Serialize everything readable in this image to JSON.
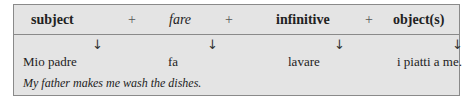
{
  "header": {
    "subject": "subject",
    "plus1": "+",
    "fare": "fare",
    "plus2": "+",
    "infinitive": "infinitive",
    "plus3": "+",
    "objects": "object(s)"
  },
  "arrows": {
    "glyph": "↓"
  },
  "example": {
    "subject": "Mio padre",
    "fare": "fa",
    "infinitive": "lavare",
    "objects": "i piatti a me."
  },
  "translation": "My father makes me wash the dishes."
}
